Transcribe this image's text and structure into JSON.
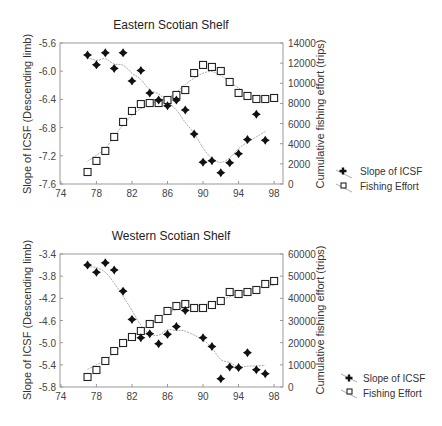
{
  "chart_data": [
    {
      "type": "scatter",
      "title": "Eastern Scotian Shelf",
      "xlabel": "",
      "ylabel": "Slope of ICSF (Descending limb)",
      "y2label": "Cumulative fishing effort (trips)",
      "xlim": [
        74,
        99
      ],
      "xticks": [
        74,
        78,
        82,
        86,
        90,
        94,
        98
      ],
      "ylim": [
        -7.6,
        -5.6
      ],
      "yticks": [
        -5.6,
        -6.0,
        -6.4,
        -6.8,
        -7.2,
        -7.6
      ],
      "y2lim": [
        0,
        14000
      ],
      "y2ticks": [
        14000,
        12000,
        10000,
        8000,
        6000,
        4000,
        2000,
        0
      ],
      "grid": false,
      "legend_position": "right-bottom",
      "series": [
        {
          "name": "Slope of ICSF",
          "axis": "left",
          "marker": "diamond-cross",
          "x": [
            77,
            78,
            79,
            80,
            81,
            82,
            83,
            84,
            85,
            86,
            87,
            88,
            89,
            90,
            91,
            92,
            93,
            94,
            95,
            96,
            97
          ],
          "values": [
            -5.77,
            -5.91,
            -5.74,
            -5.96,
            -5.74,
            -6.14,
            -5.99,
            -6.31,
            -6.41,
            -6.49,
            -6.41,
            -6.55,
            -6.89,
            -7.29,
            -7.27,
            -7.44,
            -7.3,
            -7.17,
            -6.97,
            -6.61,
            -6.98
          ]
        },
        {
          "name": "Fishing Effort",
          "axis": "right",
          "marker": "open-square",
          "x": [
            77,
            78,
            79,
            80,
            81,
            82,
            83,
            84,
            85,
            86,
            87,
            88,
            89,
            90,
            91,
            92,
            93,
            94,
            95,
            96,
            97,
            98
          ],
          "values": [
            1190,
            2290,
            3280,
            4670,
            6160,
            7250,
            7940,
            8040,
            8040,
            8340,
            8840,
            9330,
            11020,
            11820,
            11620,
            11220,
            10130,
            9040,
            8740,
            8440,
            8440,
            8540
          ]
        }
      ]
    },
    {
      "type": "scatter",
      "title": "Western Scotian Shelf",
      "xlabel": "",
      "ylabel": "Slope of ICSF (Descending limb)",
      "y2label": "Cumulative fishing effort (trips)",
      "xlim": [
        74,
        99
      ],
      "xticks": [
        74,
        78,
        82,
        86,
        90,
        94,
        98
      ],
      "ylim": [
        -5.8,
        -3.4
      ],
      "yticks": [
        -3.4,
        -3.8,
        -4.2,
        -4.6,
        -5.0,
        -5.4,
        -5.8
      ],
      "y2lim": [
        0,
        60000
      ],
      "y2ticks": [
        60000,
        50000,
        40000,
        30000,
        20000,
        10000,
        0
      ],
      "grid": false,
      "legend_position": "right-bottom",
      "series": [
        {
          "name": "Slope of ICSF",
          "axis": "left",
          "marker": "diamond-cross",
          "x": [
            77,
            78,
            79,
            80,
            81,
            82,
            83,
            84,
            85,
            86,
            87,
            88,
            90,
            91,
            92,
            93,
            94,
            95,
            96,
            97
          ],
          "values": [
            -3.6,
            -3.73,
            -3.56,
            -3.69,
            -4.07,
            -4.58,
            -4.91,
            -4.84,
            -5.02,
            -4.85,
            -4.71,
            -4.42,
            -4.91,
            -5.07,
            -5.65,
            -5.44,
            -5.45,
            -5.18,
            -5.49,
            -5.56
          ]
        },
        {
          "name": "Fishing Effort",
          "axis": "right",
          "marker": "open-square",
          "x": [
            77,
            78,
            79,
            80,
            81,
            82,
            83,
            84,
            85,
            86,
            87,
            88,
            89,
            90,
            91,
            92,
            93,
            94,
            95,
            96,
            97,
            98
          ],
          "values": [
            4510,
            7670,
            11730,
            16240,
            19850,
            22560,
            25260,
            28420,
            30680,
            34290,
            36540,
            37440,
            35640,
            35640,
            36990,
            38800,
            42860,
            41950,
            42860,
            43760,
            46470,
            47820
          ]
        }
      ]
    }
  ],
  "panels": [
    {
      "title": "Eastern Scotian Shelf",
      "ylabel": "Slope of ICSF (Descending limb)",
      "y2label": "Cumulative fishing effort (trips)",
      "legend": [
        "Slope of ICSF",
        "Fishing Effort"
      ]
    },
    {
      "title": "Western Scotian Shelf",
      "ylabel": "Slope of ICSF (Descending limb)",
      "y2label": "Cumulative fishing effort (trips)",
      "legend": [
        "Slope of ICSF",
        "Fishing Effort"
      ]
    }
  ]
}
